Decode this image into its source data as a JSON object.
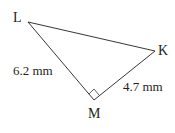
{
  "diagram": {
    "type": "right-triangle",
    "vertices": {
      "L": {
        "label": "L",
        "x": 28,
        "y": 22
      },
      "K": {
        "label": "K",
        "x": 155,
        "y": 51
      },
      "M": {
        "label": "M",
        "x": 94,
        "y": 100
      }
    },
    "right_angle_at": "M",
    "sides": {
      "LM": {
        "label": "6.2 mm"
      },
      "MK": {
        "label": "4.7 mm"
      }
    },
    "colors": {
      "stroke": "#231f20",
      "text": "#231f20"
    }
  }
}
